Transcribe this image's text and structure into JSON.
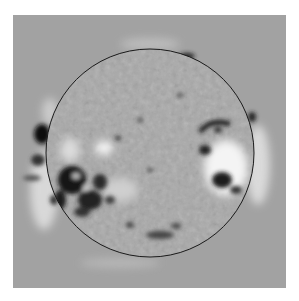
{
  "image": {
    "subject": "solar disk difference image",
    "background_color": "#a3a3a3",
    "page_color": "#ffffff",
    "limb": {
      "cx": 150,
      "cy": 153,
      "r": 104,
      "stroke": "#1a1a1a"
    },
    "features": [
      {
        "name": "east-limb-active-region",
        "cx": 88,
        "cy": 190,
        "tone": "dark"
      },
      {
        "name": "west-limb-active-region",
        "cx": 228,
        "cy": 160,
        "tone": "bright"
      },
      {
        "name": "central-bright-patch",
        "cx": 103,
        "cy": 147,
        "tone": "bright"
      },
      {
        "name": "north-limb-dark-spot",
        "cx": 187,
        "cy": 57,
        "tone": "dark"
      },
      {
        "name": "south-dark-band",
        "cx": 165,
        "cy": 233,
        "tone": "dark"
      }
    ]
  }
}
